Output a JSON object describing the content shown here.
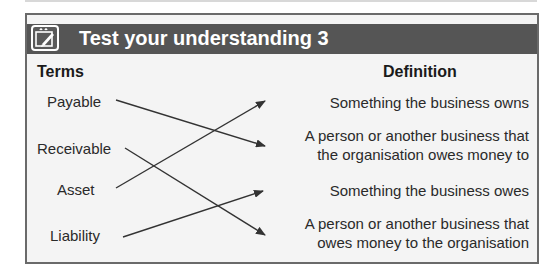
{
  "activity": {
    "title": "Test your understanding 3",
    "icon": "notepad-pencil-icon",
    "columns": {
      "terms": "Terms",
      "definition": "Definition"
    },
    "terms": [
      {
        "label": "Payable"
      },
      {
        "label": "Receivable"
      },
      {
        "label": "Asset"
      },
      {
        "label": "Liability"
      }
    ],
    "definitions": [
      {
        "line1": "Something the business owns",
        "line2": ""
      },
      {
        "line1": "A person or another business that",
        "line2": "the organisation owes money to"
      },
      {
        "line1": "Something the business owes",
        "line2": ""
      },
      {
        "line1": "A person or another business that",
        "line2": "owes money to the organisation"
      }
    ],
    "matches": [
      {
        "term": "Payable",
        "definition_index": 1
      },
      {
        "term": "Receivable",
        "definition_index": 3
      },
      {
        "term": "Asset",
        "definition_index": 0
      },
      {
        "term": "Liability",
        "definition_index": 2
      }
    ],
    "colors": {
      "header_bg": "#555555",
      "panel_bg": "#f4f4f4",
      "border": "#6a6a6a",
      "arrow": "#333333"
    }
  }
}
